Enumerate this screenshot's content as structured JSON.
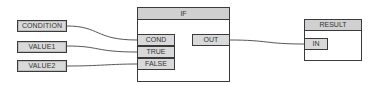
{
  "diagram": {
    "sources": [
      {
        "id": "condition",
        "label": "CONDITION"
      },
      {
        "id": "value1",
        "label": "VALUE1"
      },
      {
        "id": "value2",
        "label": "VALUE2"
      }
    ],
    "if_node": {
      "title": "IF",
      "inputs": [
        {
          "id": "cond",
          "label": "COND"
        },
        {
          "id": "true",
          "label": "TRUE"
        },
        {
          "id": "false",
          "label": "FALSE"
        }
      ],
      "outputs": [
        {
          "id": "out",
          "label": "OUT"
        }
      ]
    },
    "result_node": {
      "title": "RESULT",
      "inputs": [
        {
          "id": "in",
          "label": "IN"
        }
      ]
    },
    "connections": [
      {
        "from": "CONDITION",
        "to": "IF.COND"
      },
      {
        "from": "VALUE1",
        "to": "IF.TRUE"
      },
      {
        "from": "VALUE2",
        "to": "IF.FALSE"
      },
      {
        "from": "IF.OUT",
        "to": "RESULT.IN"
      }
    ],
    "colors": {
      "border": "#3a3a3a",
      "fill": "#d9d9d9",
      "header": "#d0d0d0",
      "wire": "#444444"
    }
  }
}
